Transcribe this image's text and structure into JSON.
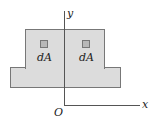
{
  "diagram": {
    "axes": {
      "x_label": "x",
      "y_label": "y",
      "origin_label": "O"
    },
    "elements": [
      {
        "label": "dA",
        "position": "left"
      },
      {
        "label": "dA",
        "position": "right"
      }
    ],
    "colors": {
      "shape_fill": "#dcdcdc",
      "element_fill": "#b8b8b8",
      "stroke": "#777777"
    }
  }
}
